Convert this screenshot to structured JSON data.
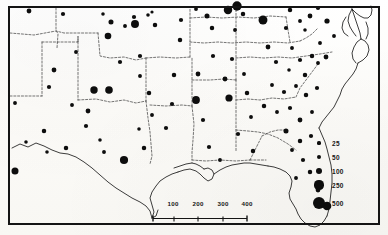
{
  "figure": {
    "kind": "graduated-symbol-map",
    "region_title": "Southern United States",
    "frame": "neatline-border"
  },
  "legend": {
    "name": "symbol-size-legend",
    "entries": [
      {
        "label": "25",
        "value": 25,
        "radius": 1.6
      },
      {
        "label": "50",
        "value": 50,
        "radius": 2.4
      },
      {
        "label": "100",
        "value": 100,
        "radius": 3.3
      },
      {
        "label": "250",
        "value": 250,
        "radius": 4.6
      },
      {
        "label": "500",
        "value": 500,
        "radius": 6.4
      }
    ],
    "rows_y": [
      143,
      157,
      171,
      185,
      203
    ]
  },
  "scale_bar": {
    "name": "distance-scale-bar",
    "unit": "miles",
    "ticks": [
      "100",
      "200",
      "300",
      "400"
    ],
    "tick_positions_pct": [
      22,
      48,
      74,
      99
    ]
  },
  "chart_data": {
    "type": "scatter",
    "xlabel": "",
    "ylabel": "",
    "symbol_scale": "area-proportional circles",
    "legend_values": [
      25,
      50,
      100,
      250,
      500
    ],
    "points": [
      {
        "x": 29,
        "y": 11,
        "v": 50
      },
      {
        "x": 54,
        "y": 70,
        "v": 50
      },
      {
        "x": 15,
        "y": 103,
        "v": 35
      },
      {
        "x": 49,
        "y": 87,
        "v": 40
      },
      {
        "x": 44,
        "y": 131,
        "v": 45
      },
      {
        "x": 26,
        "y": 142,
        "v": 30
      },
      {
        "x": 15,
        "y": 171,
        "v": 120
      },
      {
        "x": 63,
        "y": 14,
        "v": 40
      },
      {
        "x": 76,
        "y": 52,
        "v": 35
      },
      {
        "x": 103,
        "y": 14,
        "v": 30
      },
      {
        "x": 111,
        "y": 22,
        "v": 55
      },
      {
        "x": 108,
        "y": 36,
        "v": 100
      },
      {
        "x": 120,
        "y": 62,
        "v": 40
      },
      {
        "x": 94,
        "y": 90,
        "v": 140
      },
      {
        "x": 109,
        "y": 90,
        "v": 150
      },
      {
        "x": 72,
        "y": 105,
        "v": 35
      },
      {
        "x": 88,
        "y": 111,
        "v": 50
      },
      {
        "x": 86,
        "y": 126,
        "v": 40
      },
      {
        "x": 100,
        "y": 140,
        "v": 30
      },
      {
        "x": 104,
        "y": 152,
        "v": 35
      },
      {
        "x": 66,
        "y": 148,
        "v": 45
      },
      {
        "x": 47,
        "y": 152,
        "v": 30
      },
      {
        "x": 125,
        "y": 26,
        "v": 35
      },
      {
        "x": 134,
        "y": 17,
        "v": 40
      },
      {
        "x": 135,
        "y": 24,
        "v": 170
      },
      {
        "x": 148,
        "y": 15,
        "v": 30
      },
      {
        "x": 152,
        "y": 12,
        "v": 25
      },
      {
        "x": 155,
        "y": 25,
        "v": 45
      },
      {
        "x": 140,
        "y": 56,
        "v": 40
      },
      {
        "x": 140,
        "y": 76,
        "v": 35
      },
      {
        "x": 149,
        "y": 93,
        "v": 45
      },
      {
        "x": 152,
        "y": 115,
        "v": 35
      },
      {
        "x": 139,
        "y": 129,
        "v": 30
      },
      {
        "x": 124,
        "y": 160,
        "v": 180
      },
      {
        "x": 144,
        "y": 148,
        "v": 45
      },
      {
        "x": 166,
        "y": 128,
        "v": 40
      },
      {
        "x": 172,
        "y": 104,
        "v": 40
      },
      {
        "x": 174,
        "y": 75,
        "v": 45
      },
      {
        "x": 180,
        "y": 40,
        "v": 45
      },
      {
        "x": 181,
        "y": 20,
        "v": 40
      },
      {
        "x": 196,
        "y": 9,
        "v": 35
      },
      {
        "x": 207,
        "y": 16,
        "v": 55
      },
      {
        "x": 212,
        "y": 28,
        "v": 45
      },
      {
        "x": 198,
        "y": 74,
        "v": 50
      },
      {
        "x": 196,
        "y": 100,
        "v": 160
      },
      {
        "x": 203,
        "y": 120,
        "v": 40
      },
      {
        "x": 209,
        "y": 147,
        "v": 40
      },
      {
        "x": 220,
        "y": 160,
        "v": 35
      },
      {
        "x": 213,
        "y": 56,
        "v": 40
      },
      {
        "x": 228,
        "y": 10,
        "v": 200
      },
      {
        "x": 237,
        "y": 6,
        "v": 260
      },
      {
        "x": 243,
        "y": 14,
        "v": 45
      },
      {
        "x": 235,
        "y": 30,
        "v": 35
      },
      {
        "x": 232,
        "y": 59,
        "v": 40
      },
      {
        "x": 225,
        "y": 79,
        "v": 50
      },
      {
        "x": 229,
        "y": 98,
        "v": 130
      },
      {
        "x": 244,
        "y": 74,
        "v": 35
      },
      {
        "x": 247,
        "y": 93,
        "v": 45
      },
      {
        "x": 251,
        "y": 117,
        "v": 35
      },
      {
        "x": 238,
        "y": 134,
        "v": 40
      },
      {
        "x": 253,
        "y": 151,
        "v": 45
      },
      {
        "x": 263,
        "y": 20,
        "v": 230
      },
      {
        "x": 268,
        "y": 47,
        "v": 50
      },
      {
        "x": 276,
        "y": 62,
        "v": 40
      },
      {
        "x": 272,
        "y": 85,
        "v": 35
      },
      {
        "x": 286,
        "y": 28,
        "v": 40
      },
      {
        "x": 290,
        "y": 10,
        "v": 45
      },
      {
        "x": 292,
        "y": 48,
        "v": 35
      },
      {
        "x": 300,
        "y": 21,
        "v": 35
      },
      {
        "x": 305,
        "y": 30,
        "v": 30
      },
      {
        "x": 310,
        "y": 16,
        "v": 50
      },
      {
        "x": 318,
        "y": 8,
        "v": 40
      },
      {
        "x": 327,
        "y": 21,
        "v": 60
      },
      {
        "x": 334,
        "y": 36,
        "v": 35
      },
      {
        "x": 320,
        "y": 43,
        "v": 35
      },
      {
        "x": 312,
        "y": 56,
        "v": 45
      },
      {
        "x": 300,
        "y": 60,
        "v": 40
      },
      {
        "x": 289,
        "y": 70,
        "v": 30
      },
      {
        "x": 305,
        "y": 75,
        "v": 45
      },
      {
        "x": 318,
        "y": 63,
        "v": 35
      },
      {
        "x": 326,
        "y": 57,
        "v": 50
      },
      {
        "x": 284,
        "y": 92,
        "v": 40
      },
      {
        "x": 296,
        "y": 86,
        "v": 35
      },
      {
        "x": 306,
        "y": 95,
        "v": 45
      },
      {
        "x": 317,
        "y": 88,
        "v": 40
      },
      {
        "x": 264,
        "y": 106,
        "v": 45
      },
      {
        "x": 277,
        "y": 112,
        "v": 35
      },
      {
        "x": 290,
        "y": 108,
        "v": 40
      },
      {
        "x": 300,
        "y": 120,
        "v": 50
      },
      {
        "x": 312,
        "y": 112,
        "v": 35
      },
      {
        "x": 286,
        "y": 131,
        "v": 55
      },
      {
        "x": 300,
        "y": 141,
        "v": 45
      },
      {
        "x": 311,
        "y": 136,
        "v": 40
      },
      {
        "x": 292,
        "y": 150,
        "v": 35
      },
      {
        "x": 303,
        "y": 160,
        "v": 40
      },
      {
        "x": 310,
        "y": 172,
        "v": 45
      },
      {
        "x": 296,
        "y": 178,
        "v": 35
      },
      {
        "x": 318,
        "y": 190,
        "v": 50
      },
      {
        "x": 327,
        "y": 206,
        "v": 210
      }
    ]
  }
}
